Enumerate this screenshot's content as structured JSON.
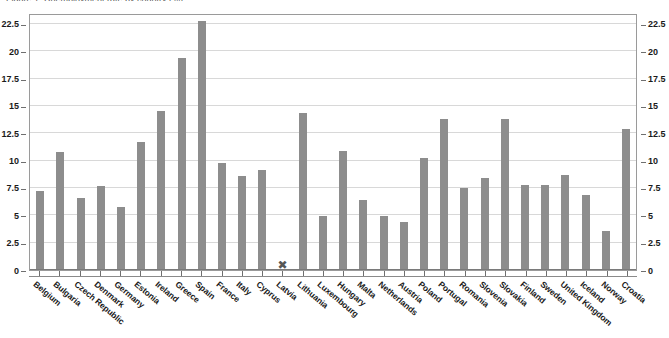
{
  "chart": {
    "title_clipped": "Figure 1: Unemployment rate by country (%)",
    "missing_marker_glyph": "✖",
    "bar_color": "#8d8d8d",
    "grid_color": "#d8d8d8",
    "frame_color": "#9a9a9a"
  },
  "axes": {
    "y_ticks": [
      "0",
      "2.5",
      "5",
      "7.5",
      "10",
      "12.5",
      "15",
      "17.5",
      "20",
      "22.5"
    ],
    "y_ticks_right": [
      "0",
      "2.5",
      "5",
      "7.5",
      "10",
      "12.5",
      "15",
      "17.5",
      "20",
      "22.5"
    ]
  },
  "chart_data": {
    "type": "bar",
    "title": "",
    "xlabel": "",
    "ylabel": "",
    "ylim": [
      0,
      23.5
    ],
    "ytick_values": [
      0,
      2.5,
      5,
      7.5,
      10,
      12.5,
      15,
      17.5,
      20,
      22.5
    ],
    "grid": true,
    "legend": "none",
    "dual_y_axis": true,
    "missing_value_marker": "✖",
    "categories": [
      "Belgium",
      "Bulgaria",
      "Czech Republic",
      "Denmark",
      "Germany",
      "Estonia",
      "Ireland",
      "Greece",
      "Spain",
      "France",
      "Italy",
      "Cyprus",
      "Latvia",
      "Lithuania",
      "Luxembourg",
      "Hungary",
      "Malta",
      "Netherlands",
      "Austria",
      "Poland",
      "Portugal",
      "Romania",
      "Slovenia",
      "Slovakia",
      "Finland",
      "Sweden",
      "United Kingdom",
      "Iceland",
      "Norway",
      "Croatia"
    ],
    "values": [
      7.2,
      10.8,
      6.6,
      7.7,
      5.8,
      11.7,
      14.5,
      19.4,
      22.8,
      9.8,
      8.6,
      9.1,
      null,
      14.4,
      4.9,
      10.9,
      6.4,
      4.9,
      4.4,
      10.2,
      13.8,
      7.5,
      8.4,
      13.8,
      7.8,
      7.8,
      8.7,
      6.9,
      3.6,
      12.9
    ]
  }
}
